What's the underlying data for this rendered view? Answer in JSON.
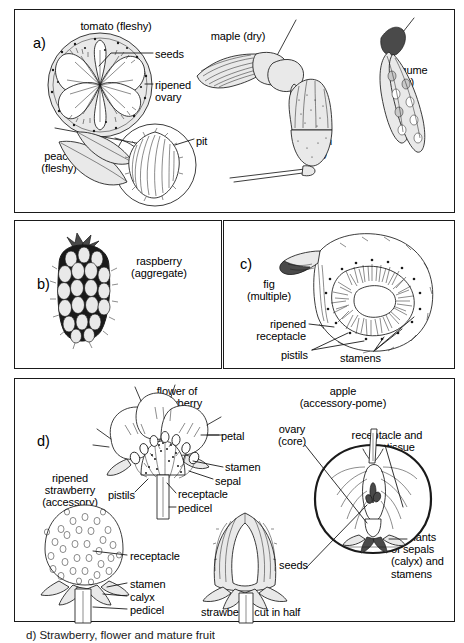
{
  "figure": {
    "caption": "d) Strawberry, flower and mature fruit",
    "panels": [
      {
        "letter": "a)",
        "name": "panel-a",
        "labels": [
          {
            "name": "tomato-label",
            "text": "tomato (fleshy)"
          },
          {
            "name": "seeds-label",
            "text": "seeds"
          },
          {
            "name": "ripened-ovary-label",
            "text": "ripened\novary"
          },
          {
            "name": "peach-label",
            "text": "peach\n(fleshy)"
          },
          {
            "name": "pit-label",
            "text": "pit"
          },
          {
            "name": "maple-label",
            "text": "maple (dry)"
          },
          {
            "name": "acorn-label",
            "text": "acorn\n(dry)"
          },
          {
            "name": "legume-label",
            "text": "legume\n(dry)"
          }
        ]
      },
      {
        "letter": "b)",
        "name": "panel-b",
        "labels": [
          {
            "name": "raspberry-label",
            "text": "raspberry\n(aggregate)"
          }
        ]
      },
      {
        "letter": "c)",
        "name": "panel-c",
        "labels": [
          {
            "name": "fig-label",
            "text": "fig\n(multiple)"
          },
          {
            "name": "ripened-receptacle-label",
            "text": "ripened\nreceptacle"
          },
          {
            "name": "pistils-label",
            "text": "pistils"
          },
          {
            "name": "stamens-label",
            "text": "stamens"
          }
        ]
      },
      {
        "letter": "d)",
        "name": "panel-d",
        "labels": [
          {
            "name": "flower-of-strawberry-label",
            "text": "flower of\nstrawberry"
          },
          {
            "name": "petal-label",
            "text": "petal"
          },
          {
            "name": "stamen-label",
            "text": "stamen"
          },
          {
            "name": "sepal-label",
            "text": "sepal"
          },
          {
            "name": "receptacle-label",
            "text": "receptacle"
          },
          {
            "name": "pedicel-label",
            "text": "pedicel"
          },
          {
            "name": "pistils-label",
            "text": "pistils"
          },
          {
            "name": "ripened-strawberry-label",
            "text": "ripened\nstrawberry\n(accessory)"
          },
          {
            "name": "receptacle-lower-label",
            "text": "receptacle"
          },
          {
            "name": "stamen-lower-label",
            "text": "stamen"
          },
          {
            "name": "calyx-label",
            "text": "calyx"
          },
          {
            "name": "pedicel-lower-label",
            "text": "pedicel"
          },
          {
            "name": "strawberry-cut-label",
            "text": "strawberry cut in half"
          },
          {
            "name": "apple-label",
            "text": "apple\n(accessory-pome)"
          },
          {
            "name": "ovary-core-label",
            "text": "ovary\n(core)"
          },
          {
            "name": "receptacle-calyx-label",
            "text": "receptacle and\ncalyx tissue"
          },
          {
            "name": "seeds-apple-label",
            "text": "seeds"
          },
          {
            "name": "remnants-label",
            "text": "remnants\nof sepals\n(calyx) and\nstamens"
          }
        ]
      }
    ]
  },
  "colors": {
    "ink": "#1a1a1a",
    "paper": "#ffffff",
    "fill_light": "#e9e9e9",
    "fill_mid": "#c9c9c9",
    "fill_dark": "#4a4a4a"
  }
}
